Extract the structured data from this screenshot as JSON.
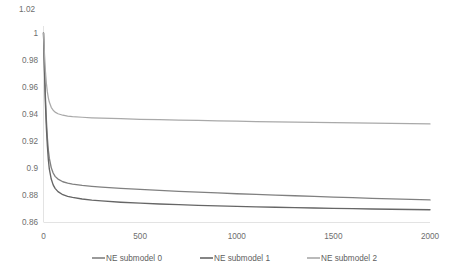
{
  "chart_data": {
    "type": "line",
    "title": "",
    "subtitle": "",
    "xlabel": "",
    "ylabel": "",
    "xlim": [
      0,
      2000
    ],
    "ylim": [
      0.86,
      1.02
    ],
    "xticks": [
      0,
      500,
      1000,
      1500,
      2000
    ],
    "xtick_labels": [
      "0",
      "500",
      "1000",
      "1500",
      "2000"
    ],
    "yticks": [
      0.86,
      0.88,
      0.9,
      0.92,
      0.94,
      0.96,
      0.98,
      1,
      1.02
    ],
    "ytick_labels": [
      "0.86",
      "0.88",
      "0.9",
      "0.92",
      "0.94",
      "0.96",
      "0.98",
      "1",
      "1.02"
    ],
    "grid": false,
    "legend_position": "bottom",
    "legend_entries": [
      "NE submodel 0",
      "NE submodel 1",
      "NE submodel 2"
    ],
    "series": [
      {
        "name": "NE submodel 0",
        "color": "#808080",
        "x": [
          0,
          5,
          10,
          15,
          20,
          25,
          30,
          40,
          50,
          60,
          75,
          100,
          125,
          150,
          200,
          250,
          300,
          400,
          500,
          600,
          700,
          800,
          900,
          1000,
          1100,
          1200,
          1300,
          1400,
          1500,
          1600,
          1700,
          1800,
          1900,
          2000
        ],
        "y": [
          1.0,
          0.975,
          0.952,
          0.935,
          0.922,
          0.913,
          0.907,
          0.9,
          0.896,
          0.8935,
          0.8915,
          0.8895,
          0.8885,
          0.8878,
          0.8868,
          0.8861,
          0.8855,
          0.8846,
          0.8838,
          0.8831,
          0.8824,
          0.8818,
          0.8812,
          0.8806,
          0.8801,
          0.8796,
          0.8791,
          0.8786,
          0.8781,
          0.8777,
          0.8772,
          0.8768,
          0.8764,
          0.876
        ]
      },
      {
        "name": "NE submodel 1",
        "color": "#666666",
        "x": [
          0,
          5,
          10,
          15,
          20,
          25,
          30,
          40,
          50,
          60,
          75,
          100,
          125,
          150,
          200,
          250,
          300,
          400,
          500,
          600,
          700,
          800,
          900,
          1000,
          1100,
          1200,
          1300,
          1400,
          1500,
          1600,
          1700,
          1800,
          1900,
          2000
        ],
        "y": [
          1.0,
          0.972,
          0.947,
          0.929,
          0.916,
          0.906,
          0.899,
          0.8915,
          0.8872,
          0.8846,
          0.8822,
          0.8799,
          0.8787,
          0.8779,
          0.8767,
          0.8759,
          0.8753,
          0.8743,
          0.8736,
          0.873,
          0.8725,
          0.872,
          0.8716,
          0.8712,
          0.8709,
          0.8706,
          0.8703,
          0.87,
          0.8698,
          0.8695,
          0.8693,
          0.8691,
          0.8689,
          0.8687
        ]
      },
      {
        "name": "NE submodel 2",
        "color": "#a9a9a9",
        "x": [
          0,
          5,
          10,
          15,
          20,
          25,
          30,
          40,
          50,
          60,
          75,
          100,
          125,
          150,
          200,
          250,
          300,
          400,
          500,
          600,
          700,
          800,
          900,
          1000,
          1100,
          1200,
          1300,
          1400,
          1500,
          1600,
          1700,
          1800,
          1900,
          2000
        ],
        "y": [
          1.0,
          0.9845,
          0.9715,
          0.9625,
          0.9562,
          0.9518,
          0.9487,
          0.9448,
          0.9426,
          0.9412,
          0.94,
          0.9389,
          0.9383,
          0.9379,
          0.9374,
          0.937,
          0.9367,
          0.9363,
          0.9359,
          0.9356,
          0.9353,
          0.935,
          0.9347,
          0.9345,
          0.9342,
          0.934,
          0.9338,
          0.9336,
          0.9334,
          0.9332,
          0.933,
          0.9328,
          0.9326,
          0.9324
        ]
      }
    ]
  },
  "axes": {
    "corner_label": "1.02"
  },
  "colors": {
    "axis": "#e3e3e3",
    "tick_text": "#6e6e6e",
    "legend_text": "#5e5e5e",
    "background": "#ffffff"
  }
}
